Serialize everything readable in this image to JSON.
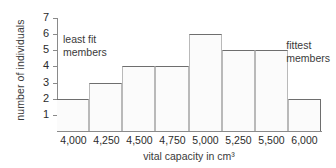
{
  "chart_data": {
    "type": "bar",
    "title": "",
    "xlabel": "vital capacity in cm³",
    "ylabel": "number of individuals",
    "categories": [
      "4,000",
      "4,250",
      "4,500",
      "4,750",
      "5,000",
      "5,250",
      "5,500",
      "6,000"
    ],
    "values": [
      2,
      3,
      4,
      4,
      6,
      5,
      5,
      2
    ],
    "ylim": [
      0,
      7
    ],
    "yticks": [
      7,
      6,
      5,
      4,
      3,
      2,
      1
    ],
    "grid": false,
    "legend": null,
    "bar_fill_color": "#fbfbfb",
    "bar_outline_color": "#6e6e6e",
    "axis_color": "#8a8a8a",
    "annotations": [
      {
        "text": "least fit\nmembers",
        "position": "upper-left"
      },
      {
        "text": "fittest\nmembers",
        "position": "upper-right"
      }
    ]
  }
}
